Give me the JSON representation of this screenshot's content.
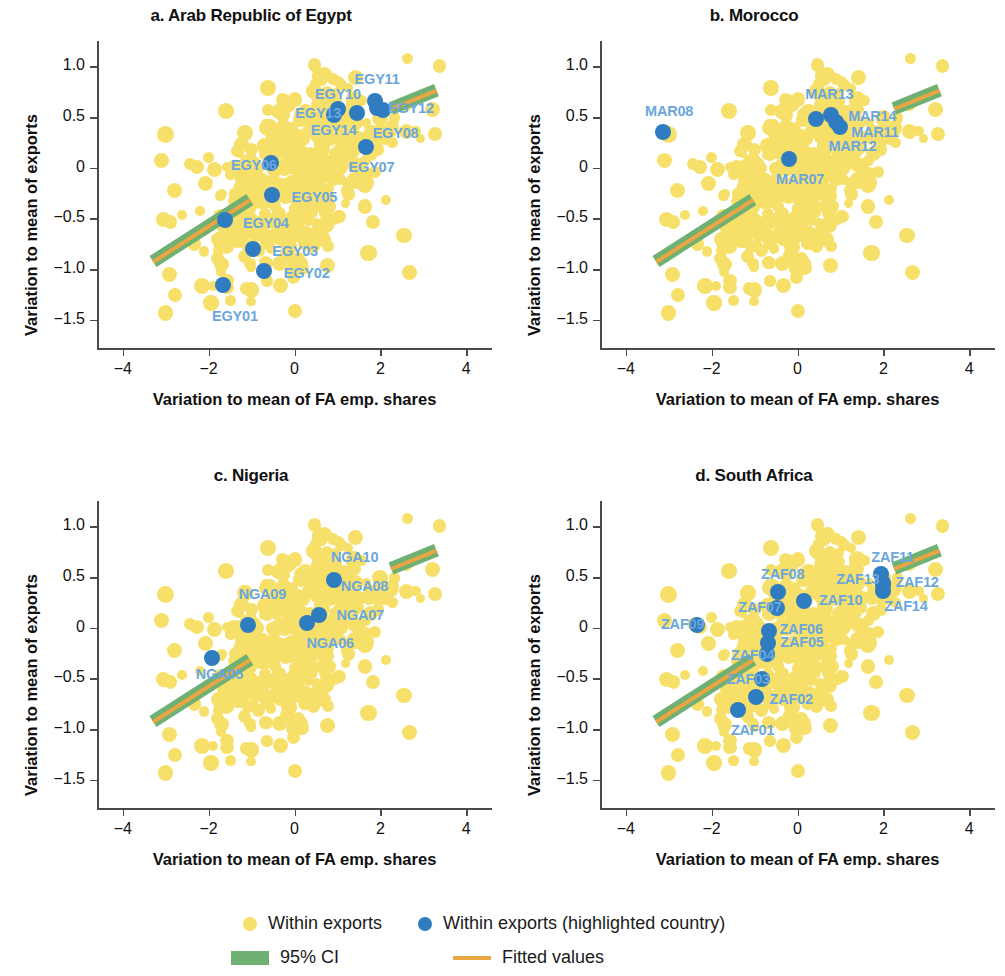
{
  "figure": {
    "axis_label_x": "Variation to mean of FA emp. shares",
    "axis_label_y": "Variation to mean of exports",
    "x_ticks": [
      "−4",
      "−2",
      "0",
      "2",
      "4"
    ],
    "y_ticks": [
      "1.0",
      "0.5",
      "0",
      "−0.5",
      "−1.0",
      "−1.5"
    ]
  },
  "legend": {
    "items": [
      {
        "marker": "yellow-dot",
        "label": "Within exports",
        "color": "#f7e06a"
      },
      {
        "marker": "blue-dot",
        "label": "Within exports (highlighted country)",
        "color": "#2f7cc0"
      },
      {
        "marker": "green-band",
        "label": "95% CI",
        "color": "#6fb172"
      },
      {
        "marker": "orange-line",
        "label": "Fitted values",
        "color": "#e9a642"
      }
    ]
  },
  "colors": {
    "background_points": "#f7e06a",
    "highlight_points": "#2f7cc0",
    "ci_band": "#6fb172",
    "fitted_line": "#e9a642",
    "point_label": "#6aa7dd",
    "axis": "#4a4a4a"
  },
  "chart_data": {
    "type": "scatter",
    "xlabel": "Variation to mean of FA emp. shares",
    "ylabel": "Variation to mean of exports",
    "xlim": [
      -4.6,
      4.6
    ],
    "ylim": [
      -1.78,
      1.22
    ],
    "xticks": [
      -4,
      -2,
      0,
      2,
      4
    ],
    "yticks": [
      1.0,
      0.5,
      0,
      -0.5,
      -1.0,
      -1.5
    ],
    "grid": false,
    "legend_position": "bottom",
    "panels": [
      {
        "id": "a",
        "label": "a. Arab Republic of Egypt",
        "country": "Arab Republic of Egypt",
        "fit_line": {
          "x": [
            -3.3,
            -1.05
          ],
          "y": [
            -0.93,
            -0.32
          ]
        },
        "fit_line_upper": {
          "x": [
            2.25,
            3.3
          ],
          "y": [
            0.58,
            0.76
          ]
        },
        "highlighted": [
          {
            "name": "EGY01",
            "x": -1.66,
            "y": -1.16
          },
          {
            "name": "EGY02",
            "x": -0.72,
            "y": -1.02
          },
          {
            "name": "EGY03",
            "x": -0.97,
            "y": -0.8
          },
          {
            "name": "EGY04",
            "x": -1.62,
            "y": -0.52
          },
          {
            "name": "EGY05",
            "x": -0.52,
            "y": -0.27
          },
          {
            "name": "EGY06",
            "x": -0.54,
            "y": 0.05
          },
          {
            "name": "EGY07",
            "x": 1.66,
            "y": 0.2
          },
          {
            "name": "EGY08",
            "x": 1.92,
            "y": 0.59
          },
          {
            "name": "EGY10",
            "x": 1.45,
            "y": 0.54
          },
          {
            "name": "EGY11",
            "x": 1.87,
            "y": 0.66
          },
          {
            "name": "EGY12",
            "x": 2.06,
            "y": 0.57
          },
          {
            "name": "EGY13",
            "x": 0.92,
            "y": 0.52
          },
          {
            "name": "EGY14",
            "x": 1.02,
            "y": 0.58
          }
        ],
        "labels": [
          {
            "name": "EGY01",
            "x": -1.92,
            "y": -1.47
          },
          {
            "name": "EGY02",
            "x": -0.25,
            "y": -1.05
          },
          {
            "name": "EGY03",
            "x": -0.52,
            "y": -0.83
          },
          {
            "name": "EGY04",
            "x": -1.2,
            "y": -0.56
          },
          {
            "name": "EGY05",
            "x": -0.07,
            "y": -0.3
          },
          {
            "name": "EGY06",
            "x": -1.48,
            "y": 0.02
          },
          {
            "name": "EGY07",
            "x": 1.26,
            "y": 0.0
          },
          {
            "name": "EGY08",
            "x": 1.82,
            "y": 0.33
          },
          {
            "name": "EGY10",
            "x": 0.48,
            "y": 0.72
          },
          {
            "name": "EGY11",
            "x": 1.4,
            "y": 0.86
          },
          {
            "name": "EGY12",
            "x": 2.18,
            "y": 0.58
          },
          {
            "name": "EGY13",
            "x": 0.02,
            "y": 0.53
          },
          {
            "name": "EGY14",
            "x": 0.38,
            "y": 0.36
          }
        ]
      },
      {
        "id": "b",
        "label": "b. Morocco",
        "country": "Morocco",
        "fit_line": {
          "x": [
            -3.3,
            -1.05
          ],
          "y": [
            -0.93,
            -0.32
          ]
        },
        "fit_line_upper": {
          "x": [
            2.25,
            3.3
          ],
          "y": [
            0.58,
            0.76
          ]
        },
        "highlighted": [
          {
            "name": "MAR07",
            "x": -0.2,
            "y": 0.09
          },
          {
            "name": "MAR08",
            "x": -3.14,
            "y": 0.35
          },
          {
            "name": "MAR11",
            "x": 1.0,
            "y": 0.4
          },
          {
            "name": "MAR12",
            "x": 0.9,
            "y": 0.45
          },
          {
            "name": "MAR13",
            "x": 0.42,
            "y": 0.48
          },
          {
            "name": "MAR14",
            "x": 0.78,
            "y": 0.52
          }
        ],
        "labels": [
          {
            "name": "MAR07",
            "x": -0.5,
            "y": -0.12
          },
          {
            "name": "MAR08",
            "x": -3.55,
            "y": 0.55
          },
          {
            "name": "MAR11",
            "x": 1.25,
            "y": 0.34
          },
          {
            "name": "MAR12",
            "x": 0.72,
            "y": 0.2
          },
          {
            "name": "MAR13",
            "x": 0.18,
            "y": 0.72
          },
          {
            "name": "MAR14",
            "x": 1.18,
            "y": 0.5
          }
        ]
      },
      {
        "id": "c",
        "label": "c. Nigeria",
        "country": "Nigeria",
        "fit_line": {
          "x": [
            -3.3,
            -1.05
          ],
          "y": [
            -0.93,
            -0.32
          ]
        },
        "fit_line_upper": {
          "x": [
            2.25,
            3.3
          ],
          "y": [
            0.58,
            0.76
          ]
        },
        "highlighted": [
          {
            "name": "NGA05",
            "x": -1.92,
            "y": -0.3
          },
          {
            "name": "NGA06",
            "x": 0.28,
            "y": 0.05
          },
          {
            "name": "NGA07",
            "x": 0.56,
            "y": 0.12
          },
          {
            "name": "NGA08",
            "x": 0.92,
            "y": 0.47
          },
          {
            "name": "NGA09",
            "x": -1.08,
            "y": 0.03
          }
        ],
        "labels": [
          {
            "name": "NGA05",
            "x": -2.3,
            "y": -0.47
          },
          {
            "name": "NGA06",
            "x": 0.28,
            "y": -0.16
          },
          {
            "name": "NGA07",
            "x": 0.98,
            "y": 0.11
          },
          {
            "name": "NGA08",
            "x": 1.08,
            "y": 0.4
          },
          {
            "name": "NGA09",
            "x": -1.3,
            "y": 0.32
          },
          {
            "name": "NGA10",
            "x": 0.85,
            "y": 0.69
          }
        ]
      },
      {
        "id": "d",
        "label": "d. South Africa",
        "country": "South Africa",
        "fit_line": {
          "x": [
            -3.3,
            -1.05
          ],
          "y": [
            -0.93,
            -0.32
          ]
        },
        "fit_line_upper": {
          "x": [
            2.25,
            3.3
          ],
          "y": [
            0.58,
            0.76
          ]
        },
        "highlighted": [
          {
            "name": "ZAF01",
            "x": -1.38,
            "y": -0.81
          },
          {
            "name": "ZAF02",
            "x": -0.97,
            "y": -0.68
          },
          {
            "name": "ZAF03",
            "x": -0.82,
            "y": -0.51
          },
          {
            "name": "ZAF04",
            "x": -0.7,
            "y": -0.26
          },
          {
            "name": "ZAF05",
            "x": -0.68,
            "y": -0.15
          },
          {
            "name": "ZAF06",
            "x": -0.66,
            "y": -0.03
          },
          {
            "name": "ZAF07",
            "x": -0.48,
            "y": 0.19
          },
          {
            "name": "ZAF08",
            "x": -0.46,
            "y": 0.35
          },
          {
            "name": "ZAF09",
            "x": -2.34,
            "y": 0.03
          },
          {
            "name": "ZAF10",
            "x": 0.16,
            "y": 0.26
          },
          {
            "name": "ZAF11",
            "x": 1.94,
            "y": 0.53
          },
          {
            "name": "ZAF12",
            "x": 1.98,
            "y": 0.42
          },
          {
            "name": "ZAF13",
            "x": 2.0,
            "y": 0.44
          },
          {
            "name": "ZAF14",
            "x": 1.99,
            "y": 0.36
          }
        ],
        "labels": [
          {
            "name": "ZAF01",
            "x": -1.55,
            "y": -1.02
          },
          {
            "name": "ZAF02",
            "x": -0.65,
            "y": -0.71
          },
          {
            "name": "ZAF03",
            "x": -1.65,
            "y": -0.52
          },
          {
            "name": "ZAF04",
            "x": -1.55,
            "y": -0.28
          },
          {
            "name": "ZAF05",
            "x": -0.4,
            "y": -0.15
          },
          {
            "name": "ZAF06",
            "x": -0.42,
            "y": -0.02
          },
          {
            "name": "ZAF07",
            "x": -1.38,
            "y": 0.19
          },
          {
            "name": "ZAF08",
            "x": -0.85,
            "y": 0.52
          },
          {
            "name": "ZAF09",
            "x": -3.18,
            "y": 0.03
          },
          {
            "name": "ZAF10",
            "x": 0.5,
            "y": 0.26
          },
          {
            "name": "ZAF11",
            "x": 1.72,
            "y": 0.69
          },
          {
            "name": "ZAF12",
            "x": 2.28,
            "y": 0.44
          },
          {
            "name": "ZAF13",
            "x": 0.9,
            "y": 0.47
          },
          {
            "name": "ZAF14",
            "x": 2.02,
            "y": 0.2
          }
        ]
      }
    ],
    "background_cloud_note": "Dense yellow scatter cloud of within-country export variation, approx 500 points per panel, concentrated between x −1.5 and 1.5 and y −1.0 and 0.7, with positive correlation."
  }
}
